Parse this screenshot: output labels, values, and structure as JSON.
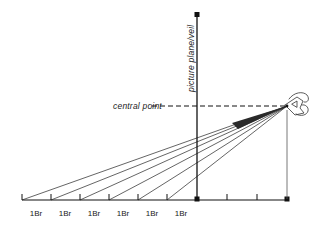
{
  "figure": {
    "type": "perspective-construction-diagram",
    "background_color": "#ffffff",
    "line_color": "#111111",
    "labels": {
      "central_point": "central point",
      "picture_plane": "picture plane/veil"
    },
    "ground_line": {
      "unit_label": "1Br",
      "unit_labels": [
        "1Br",
        "1Br",
        "1Br",
        "1Br",
        "1Br",
        "1Br"
      ],
      "division_count": 6,
      "left_x": 22,
      "right_x": 287,
      "y": 200,
      "tick_positions": [
        22,
        51,
        80,
        109,
        138,
        167,
        197,
        227,
        257,
        287
      ],
      "label_positions": [
        36,
        65,
        94,
        123,
        152,
        181
      ]
    },
    "picture_plane_axis": {
      "x": 197,
      "top_y": 14,
      "bottom_y": 200,
      "label_text": "picture plane/veil",
      "label_rotation": -90,
      "label_x": 194,
      "label_y": 92
    },
    "central_point": {
      "x": 197,
      "y": 106,
      "label_text": "central point",
      "label_x": 113,
      "label_y": 107
    },
    "eye_point": {
      "x": 287,
      "y": 106,
      "icon": "eye-icon"
    },
    "rays": {
      "count": 6,
      "origin_x": 287,
      "origin_y": 106,
      "endpoints_x": [
        22,
        51,
        80,
        109,
        138,
        167
      ],
      "endpoints_y": 200
    },
    "horizon_dashed_line": {
      "from_x": 152,
      "to_x": 287,
      "y": 106
    }
  }
}
